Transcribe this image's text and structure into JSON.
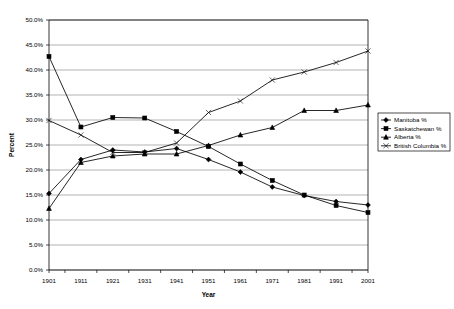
{
  "chart_data": {
    "type": "line",
    "title": "",
    "xlabel": "Year",
    "ylabel": "Percent",
    "categories": [
      "1901",
      "1911",
      "1921",
      "1931",
      "1941",
      "1951",
      "1961",
      "1971",
      "1981",
      "1991",
      "2001"
    ],
    "x": [
      1901,
      1911,
      1921,
      1931,
      1941,
      1951,
      1961,
      1971,
      1981,
      1991,
      2001
    ],
    "xlim": [
      1901,
      2001
    ],
    "ylim": [
      0,
      50
    ],
    "ytick_labels": [
      "0.0%",
      "5.0%",
      "10.0%",
      "15.0%",
      "20.0%",
      "25.0%",
      "30.0%",
      "35.0%",
      "40.0%",
      "45.0%",
      "50.0%"
    ],
    "ytick_values": [
      0,
      5,
      10,
      15,
      20,
      25,
      30,
      35,
      40,
      45,
      50
    ],
    "grid": "horizontal",
    "legend_position": "right",
    "series": [
      {
        "name": "Manitoba %",
        "marker": "diamond",
        "values": [
          15.3,
          22.1,
          24.0,
          23.6,
          24.3,
          22.1,
          19.6,
          16.6,
          14.9,
          13.7,
          13.0
        ]
      },
      {
        "name": "Saskatchewan %",
        "marker": "square",
        "values": [
          42.7,
          28.6,
          30.5,
          30.4,
          27.7,
          24.7,
          21.2,
          17.9,
          15.0,
          12.9,
          11.5
        ]
      },
      {
        "name": "Alberta %",
        "marker": "triangle",
        "values": [
          12.3,
          21.5,
          22.8,
          23.2,
          23.2,
          24.9,
          27.0,
          28.5,
          31.9,
          31.9,
          33.0
        ]
      },
      {
        "name": "British Columbia %",
        "marker": "cross",
        "values": [
          29.9,
          27.0,
          23.5,
          23.5,
          25.4,
          31.5,
          33.8,
          38.0,
          39.6,
          41.5,
          43.8
        ]
      }
    ]
  },
  "legend": {
    "items": [
      {
        "label": "Manitoba %"
      },
      {
        "label": "Saskatchewan %"
      },
      {
        "label": "Alberta %"
      },
      {
        "label": "British Columbia %"
      }
    ]
  }
}
